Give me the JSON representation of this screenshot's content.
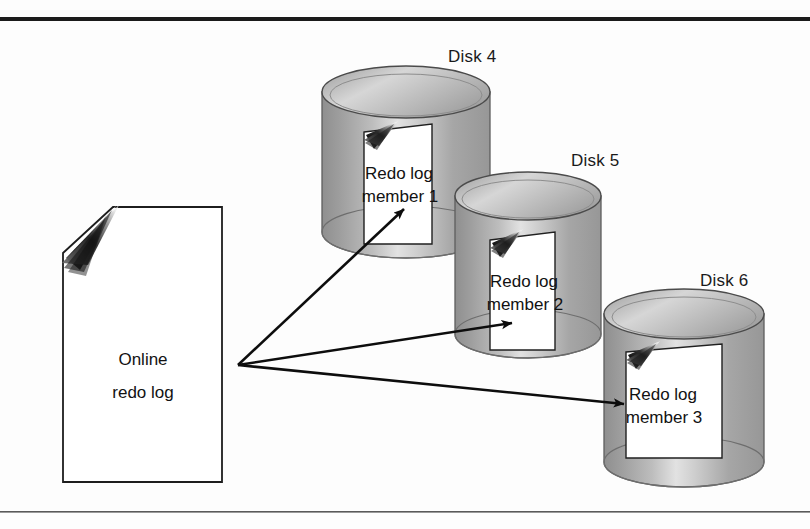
{
  "figure": {
    "kind": "diagram",
    "background_color": "#fdfdfd",
    "rules": {
      "top_rule_color": "#1b1b1b",
      "bottom_rule_color": "#4a4a4a"
    }
  },
  "source_document": {
    "name": "online-redo-log",
    "line1": "Online",
    "line2": "redo log",
    "fill": "#ffffff",
    "stroke": "#1d1d1d"
  },
  "disks": [
    {
      "label": "Disk 4",
      "cylinder_fill": "#a9a9a9",
      "document": {
        "line1": "Redo log",
        "line2": "member 1"
      }
    },
    {
      "label": "Disk 5",
      "cylinder_fill": "#a9a9a9",
      "document": {
        "line1": "Redo log",
        "line2": "member 2"
      }
    },
    {
      "label": "Disk 6",
      "cylinder_fill": "#a9a9a9",
      "document": {
        "line1": "Redo log",
        "line2": "member 3"
      }
    }
  ],
  "arrows": {
    "origin_label": "online redo log writer fan-out point",
    "count": 3,
    "color": "#0d0d0d"
  }
}
